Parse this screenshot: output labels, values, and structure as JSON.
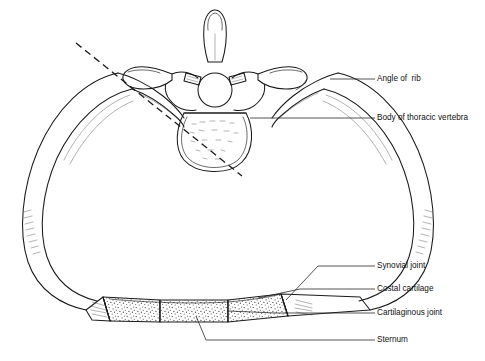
{
  "figure": {
    "background_color": "#ffffff",
    "ink_color": "#1a1a1a",
    "label_color": "#111111"
  },
  "labels": [
    {
      "id": "angle-of-rib",
      "text": "Angle of  rib",
      "text_x": 377,
      "text_y": 79,
      "leader": "M 355 79 L 377 79",
      "target": "left edge of right rib angle"
    },
    {
      "id": "body-of-thoracic-vertebra",
      "text": "Body of thoracic vertebra",
      "text_x": 377,
      "text_y": 118,
      "leader": "M 355 118 L 377 118",
      "target": "vertebral body"
    },
    {
      "id": "synovial-joint",
      "text": "Synovial joint",
      "text_x": 377,
      "text_y": 266,
      "leader": "M 355 266 L 377 266",
      "target": "sternocostal synovial joint"
    },
    {
      "id": "costal-cartilage",
      "text": "Costal cartilage",
      "text_x": 377,
      "text_y": 289,
      "leader": "M 355 289 L 377 289",
      "target": "right costal cartilage"
    },
    {
      "id": "cartilaginous-joint",
      "text": "Cartilaginous joint",
      "text_x": 377,
      "text_y": 313,
      "leader": "M 355 313 L 377 313",
      "target": "cartilaginous junction"
    },
    {
      "id": "sternum",
      "text": "Sternum",
      "text_x": 377,
      "text_y": 340,
      "leader": "M 355 340 L 377 340",
      "target": "sternum body"
    }
  ],
  "structures": [
    {
      "id": "spinous-process",
      "name": "Spinous process"
    },
    {
      "id": "transverse-process-left",
      "name": "Left transverse process"
    },
    {
      "id": "transverse-process-right",
      "name": "Right transverse process"
    },
    {
      "id": "vertebral-foramen",
      "name": "Vertebral foramen"
    },
    {
      "id": "vertebral-body",
      "name": "Body of thoracic vertebra"
    },
    {
      "id": "rib-left",
      "name": "Left rib"
    },
    {
      "id": "rib-right",
      "name": "Right rib"
    },
    {
      "id": "costal-cartilage-left",
      "name": "Left costal cartilage"
    },
    {
      "id": "costal-cartilage-right",
      "name": "Right costal cartilage"
    },
    {
      "id": "sternum-body",
      "name": "Sternum"
    },
    {
      "id": "section-plane-line",
      "name": "Dashed section plane line"
    }
  ]
}
